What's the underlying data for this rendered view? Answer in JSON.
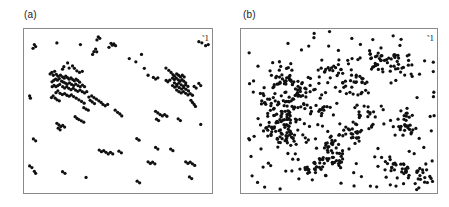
{
  "figure": {
    "background_color": "#ffffff",
    "point_color": "#101010",
    "frame_color": "#8a8a8a"
  },
  "panels": [
    {
      "id": "a",
      "label": "(a)",
      "corner_mark": "1",
      "corner_mark_sup": "x"
    },
    {
      "id": "b",
      "label": "(b)",
      "corner_mark": "1",
      "corner_mark_sup": "x"
    }
  ],
  "chart_data": [
    {
      "type": "scatter",
      "title": "(a)",
      "xlabel": "",
      "ylabel": "",
      "xlim": [
        0,
        1
      ],
      "ylim": [
        0,
        1
      ],
      "grid": false,
      "legend": "none",
      "marker": "filled-circle",
      "marker_size_px": 2.6,
      "color": "#101010",
      "n_points": 196,
      "description": "Sparse clustered point pattern with two dense aggregations (left-centre and right-centre) on a sparse random background.",
      "points": [
        [
          0.055,
          0.905
        ],
        [
          0.062,
          0.893
        ],
        [
          0.048,
          0.882
        ],
        [
          0.175,
          0.915
        ],
        [
          0.3,
          0.905
        ],
        [
          0.395,
          0.952
        ],
        [
          0.403,
          0.943
        ],
        [
          0.388,
          0.933
        ],
        [
          0.381,
          0.878
        ],
        [
          0.372,
          0.862
        ],
        [
          0.387,
          0.861
        ],
        [
          0.365,
          0.845
        ],
        [
          0.463,
          0.913
        ],
        [
          0.47,
          0.901
        ],
        [
          0.478,
          0.909
        ],
        [
          0.487,
          0.898
        ],
        [
          0.452,
          0.888
        ],
        [
          0.93,
          0.923
        ],
        [
          0.946,
          0.916
        ],
        [
          0.56,
          0.82
        ],
        [
          0.625,
          0.845
        ],
        [
          0.232,
          0.793
        ],
        [
          0.212,
          0.77
        ],
        [
          0.205,
          0.755
        ],
        [
          0.24,
          0.762
        ],
        [
          0.258,
          0.775
        ],
        [
          0.268,
          0.76
        ],
        [
          0.281,
          0.745
        ],
        [
          0.295,
          0.735
        ],
        [
          0.31,
          0.742
        ],
        [
          0.163,
          0.742
        ],
        [
          0.148,
          0.735
        ],
        [
          0.139,
          0.726
        ],
        [
          0.156,
          0.718
        ],
        [
          0.172,
          0.724
        ],
        [
          0.181,
          0.712
        ],
        [
          0.194,
          0.718
        ],
        [
          0.205,
          0.708
        ],
        [
          0.214,
          0.7
        ],
        [
          0.222,
          0.712
        ],
        [
          0.231,
          0.704
        ],
        [
          0.24,
          0.694
        ],
        [
          0.25,
          0.702
        ],
        [
          0.259,
          0.692
        ],
        [
          0.268,
          0.684
        ],
        [
          0.277,
          0.695
        ],
        [
          0.286,
          0.686
        ],
        [
          0.296,
          0.676
        ],
        [
          0.188,
          0.698
        ],
        [
          0.178,
          0.688
        ],
        [
          0.168,
          0.695
        ],
        [
          0.158,
          0.686
        ],
        [
          0.149,
          0.678
        ],
        [
          0.2,
          0.682
        ],
        [
          0.21,
          0.676
        ],
        [
          0.22,
          0.67
        ],
        [
          0.23,
          0.664
        ],
        [
          0.242,
          0.672
        ],
        [
          0.253,
          0.662
        ],
        [
          0.264,
          0.655
        ],
        [
          0.275,
          0.664
        ],
        [
          0.287,
          0.655
        ],
        [
          0.299,
          0.648
        ],
        [
          0.311,
          0.658
        ],
        [
          0.322,
          0.648
        ],
        [
          0.19,
          0.662
        ],
        [
          0.18,
          0.655
        ],
        [
          0.17,
          0.648
        ],
        [
          0.16,
          0.656
        ],
        [
          0.15,
          0.648
        ],
        [
          0.206,
          0.648
        ],
        [
          0.216,
          0.64
        ],
        [
          0.227,
          0.648
        ],
        [
          0.238,
          0.638
        ],
        [
          0.25,
          0.63
        ],
        [
          0.262,
          0.638
        ],
        [
          0.274,
          0.628
        ],
        [
          0.286,
          0.62
        ],
        [
          0.298,
          0.628
        ],
        [
          0.31,
          0.618
        ],
        [
          0.322,
          0.61
        ],
        [
          0.334,
          0.618
        ],
        [
          0.18,
          0.622
        ],
        [
          0.17,
          0.612
        ],
        [
          0.192,
          0.608
        ],
        [
          0.204,
          0.6
        ],
        [
          0.216,
          0.606
        ],
        [
          0.228,
          0.596
        ],
        [
          0.24,
          0.59
        ],
        [
          0.252,
          0.598
        ],
        [
          0.264,
          0.588
        ],
        [
          0.278,
          0.578
        ],
        [
          0.292,
          0.568
        ],
        [
          0.306,
          0.558
        ],
        [
          0.32,
          0.548
        ],
        [
          0.155,
          0.592
        ],
        [
          0.146,
          0.582
        ],
        [
          0.166,
          0.578
        ],
        [
          0.176,
          0.568
        ],
        [
          0.188,
          0.562
        ],
        [
          0.03,
          0.592
        ],
        [
          0.034,
          0.578
        ],
        [
          0.755,
          0.762
        ],
        [
          0.77,
          0.748
        ],
        [
          0.782,
          0.735
        ],
        [
          0.792,
          0.722
        ],
        [
          0.8,
          0.712
        ],
        [
          0.812,
          0.726
        ],
        [
          0.822,
          0.718
        ],
        [
          0.832,
          0.708
        ],
        [
          0.842,
          0.718
        ],
        [
          0.852,
          0.708
        ],
        [
          0.79,
          0.7
        ],
        [
          0.8,
          0.692
        ],
        [
          0.81,
          0.7
        ],
        [
          0.82,
          0.69
        ],
        [
          0.83,
          0.682
        ],
        [
          0.84,
          0.692
        ],
        [
          0.85,
          0.682
        ],
        [
          0.86,
          0.672
        ],
        [
          0.775,
          0.688
        ],
        [
          0.765,
          0.678
        ],
        [
          0.756,
          0.686
        ],
        [
          0.8,
          0.672
        ],
        [
          0.812,
          0.662
        ],
        [
          0.824,
          0.67
        ],
        [
          0.836,
          0.66
        ],
        [
          0.848,
          0.652
        ],
        [
          0.86,
          0.66
        ],
        [
          0.872,
          0.65
        ],
        [
          0.79,
          0.655
        ],
        [
          0.802,
          0.645
        ],
        [
          0.814,
          0.652
        ],
        [
          0.826,
          0.642
        ],
        [
          0.838,
          0.634
        ],
        [
          0.85,
          0.642
        ],
        [
          0.862,
          0.632
        ],
        [
          0.875,
          0.622
        ],
        [
          0.812,
          0.628
        ],
        [
          0.824,
          0.618
        ],
        [
          0.836,
          0.61
        ],
        [
          0.848,
          0.618
        ],
        [
          0.86,
          0.608
        ],
        [
          0.872,
          0.598
        ],
        [
          0.884,
          0.606
        ],
        [
          0.896,
          0.596
        ],
        [
          0.905,
          0.65
        ],
        [
          0.916,
          0.64
        ],
        [
          0.93,
          0.668
        ],
        [
          0.94,
          0.655
        ],
        [
          0.688,
          0.705
        ],
        [
          0.7,
          0.695
        ],
        [
          0.712,
          0.702
        ],
        [
          0.66,
          0.718
        ],
        [
          0.64,
          0.76
        ],
        [
          0.595,
          0.8
        ],
        [
          0.888,
          0.565
        ],
        [
          0.896,
          0.552
        ],
        [
          0.905,
          0.54
        ],
        [
          0.912,
          0.528
        ],
        [
          0.345,
          0.585
        ],
        [
          0.36,
          0.592
        ],
        [
          0.372,
          0.582
        ],
        [
          0.385,
          0.572
        ],
        [
          0.398,
          0.562
        ],
        [
          0.41,
          0.552
        ],
        [
          0.42,
          0.54
        ],
        [
          0.432,
          0.532
        ],
        [
          0.445,
          0.54
        ],
        [
          0.352,
          0.565
        ],
        [
          0.363,
          0.555
        ],
        [
          0.375,
          0.545
        ],
        [
          0.318,
          0.52
        ],
        [
          0.33,
          0.512
        ],
        [
          0.342,
          0.505
        ],
        [
          0.485,
          0.505
        ],
        [
          0.498,
          0.492
        ],
        [
          0.51,
          0.482
        ],
        [
          0.52,
          0.47
        ],
        [
          0.272,
          0.465
        ],
        [
          0.282,
          0.455
        ],
        [
          0.292,
          0.448
        ],
        [
          0.305,
          0.44
        ],
        [
          0.318,
          0.432
        ],
        [
          0.175,
          0.425
        ],
        [
          0.186,
          0.415
        ],
        [
          0.196,
          0.405
        ],
        [
          0.206,
          0.412
        ],
        [
          0.216,
          0.402
        ],
        [
          0.182,
          0.395
        ],
        [
          0.192,
          0.385
        ],
        [
          0.7,
          0.498
        ],
        [
          0.712,
          0.488
        ],
        [
          0.724,
          0.478
        ],
        [
          0.736,
          0.47
        ],
        [
          0.748,
          0.478
        ],
        [
          0.76,
          0.468
        ],
        [
          0.705,
          0.45
        ],
        [
          0.716,
          0.442
        ],
        [
          0.82,
          0.452
        ],
        [
          0.832,
          0.442
        ],
        [
          0.94,
          0.418
        ],
        [
          0.05,
          0.33
        ],
        [
          0.062,
          0.318
        ],
        [
          0.6,
          0.332
        ],
        [
          0.612,
          0.322
        ],
        [
          0.4,
          0.262
        ],
        [
          0.412,
          0.252
        ],
        [
          0.424,
          0.258
        ],
        [
          0.436,
          0.248
        ],
        [
          0.448,
          0.238
        ],
        [
          0.46,
          0.248
        ],
        [
          0.472,
          0.238
        ],
        [
          0.7,
          0.278
        ],
        [
          0.712,
          0.268
        ],
        [
          0.78,
          0.268
        ],
        [
          0.792,
          0.258
        ],
        [
          0.66,
          0.19
        ],
        [
          0.672,
          0.18
        ],
        [
          0.684,
          0.188
        ],
        [
          0.696,
          0.178
        ],
        [
          0.86,
          0.19
        ],
        [
          0.872,
          0.18
        ],
        [
          0.884,
          0.188
        ],
        [
          0.896,
          0.178
        ],
        [
          0.908,
          0.168
        ],
        [
          0.505,
          0.255
        ],
        [
          0.518,
          0.245
        ],
        [
          0.03,
          0.165
        ],
        [
          0.042,
          0.155
        ],
        [
          0.055,
          0.132
        ],
        [
          0.062,
          0.12
        ],
        [
          0.205,
          0.13
        ],
        [
          0.218,
          0.12
        ],
        [
          0.33,
          0.095
        ],
        [
          0.88,
          0.098
        ],
        [
          0.892,
          0.088
        ],
        [
          0.602,
          0.072
        ],
        [
          0.615,
          0.062
        ],
        [
          0.98,
          0.905
        ],
        [
          0.966,
          0.898
        ]
      ]
    },
    {
      "type": "scatter",
      "title": "(b)",
      "xlabel": "",
      "ylabel": "",
      "xlim": [
        0,
        1
      ],
      "ylim": [
        0,
        1
      ],
      "grid": false,
      "legend": "none",
      "marker": "filled-circle",
      "marker_size_px": 2.6,
      "color": "#101010",
      "n_points": 612,
      "description": "Dense, strongly clustered point pattern: numerous large blob-like aggregations spread across the unit square on a moderately dense random background.",
      "cluster_centers": [
        [
          0.205,
          0.7
        ],
        [
          0.3,
          0.64
        ],
        [
          0.255,
          0.565
        ],
        [
          0.17,
          0.56
        ],
        [
          0.38,
          0.51
        ],
        [
          0.235,
          0.47
        ],
        [
          0.17,
          0.375
        ],
        [
          0.25,
          0.35
        ],
        [
          0.43,
          0.3
        ],
        [
          0.36,
          0.175
        ],
        [
          0.49,
          0.215
        ],
        [
          0.575,
          0.365
        ],
        [
          0.64,
          0.47
        ],
        [
          0.69,
          0.805
        ],
        [
          0.79,
          0.79
        ],
        [
          0.835,
          0.42
        ],
        [
          0.8,
          0.16
        ],
        [
          0.905,
          0.09
        ],
        [
          0.59,
          0.65
        ],
        [
          0.46,
          0.76
        ]
      ],
      "cluster_spread": 0.038,
      "points_per_cluster": 24,
      "background_points": 130
    }
  ]
}
